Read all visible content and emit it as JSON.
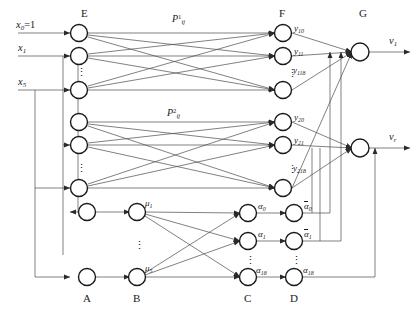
{
  "figure": {
    "columns": [
      {
        "id": "A",
        "label": "A",
        "position": "bottom"
      },
      {
        "id": "B",
        "label": "B",
        "position": "bottom"
      },
      {
        "id": "C",
        "label": "C",
        "position": "bottom"
      },
      {
        "id": "D",
        "label": "D",
        "position": "bottom"
      },
      {
        "id": "E",
        "label": "E",
        "position": "top"
      },
      {
        "id": "F",
        "label": "F",
        "position": "top"
      },
      {
        "id": "G",
        "label": "G",
        "position": "top"
      }
    ]
  },
  "inputs": [
    {
      "id": "x0",
      "label_main": "x",
      "label_sub": "0",
      "label_tail": "=1"
    },
    {
      "id": "x1",
      "label_main": "x",
      "label_sub": "1",
      "label_tail": ""
    },
    {
      "id": "x5",
      "label_main": "x",
      "label_sub": "5",
      "label_tail": ""
    }
  ],
  "outputs": [
    {
      "id": "v1",
      "label_main": "v",
      "label_sub": "1"
    },
    {
      "id": "vr",
      "label_main": "v",
      "label_sub": "r"
    }
  ],
  "weights": [
    {
      "id": "P1",
      "base": "P",
      "sup": "1",
      "sub": "ij"
    },
    {
      "id": "P2",
      "base": "P",
      "sup": "2",
      "sub": "ij"
    }
  ],
  "layer_F": {
    "block1": [
      {
        "base": "y",
        "sub": "10"
      },
      {
        "base": "y",
        "sub": "11"
      },
      {
        "base": "y",
        "sub": "118"
      }
    ],
    "block2": [
      {
        "base": "y",
        "sub": "20"
      },
      {
        "base": "y",
        "sub": "21"
      },
      {
        "base": "y",
        "sub": "218"
      }
    ]
  },
  "layer_B": [
    {
      "base": "μ",
      "sub": "1"
    },
    {
      "base": "μ",
      "sub": "5"
    }
  ],
  "layer_C": [
    {
      "base": "α",
      "sub": "0"
    },
    {
      "base": "α",
      "sub": "1"
    },
    {
      "base": "α",
      "sub": "18"
    }
  ],
  "layer_D": [
    {
      "base": "α",
      "sub": "0",
      "overbar": true
    },
    {
      "base": "α",
      "sub": "1",
      "overbar": true
    },
    {
      "base": "α",
      "sub": "18",
      "overbar": false
    }
  ],
  "ellipsis": "⋮",
  "colors": {
    "stroke": "#3a3a3a",
    "node_stroke": "#1a1a1a",
    "text": "#1a1a1a",
    "background": "#ffffff"
  }
}
